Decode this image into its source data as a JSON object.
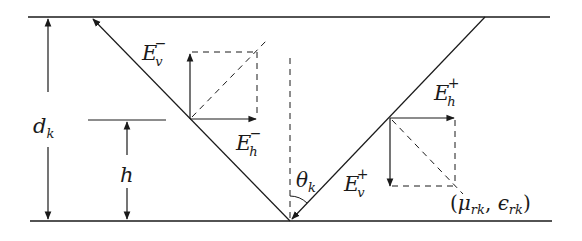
{
  "diagram": {
    "type": "layer-reflection-geometry",
    "colors": {
      "line": "#1a1a1a",
      "background": "#ffffff"
    },
    "boundaries": [
      {
        "name": "top-boundary",
        "y": 17
      },
      {
        "name": "bottom-boundary",
        "y": 221
      }
    ],
    "labels": {
      "thickness": {
        "base": "d",
        "sub": "k"
      },
      "height": {
        "base": "h"
      },
      "angle": {
        "base": "θ",
        "sub": "k"
      },
      "ev_minus": {
        "base": "E",
        "sub": "v",
        "sup": "−"
      },
      "eh_minus": {
        "base": "E",
        "sub": "h",
        "sup": "−"
      },
      "eh_plus": {
        "base": "E",
        "sub": "h",
        "sup": "+"
      },
      "ev_plus": {
        "base": "E",
        "sub": "v",
        "sup": "+"
      },
      "medium": {
        "open": "(",
        "mu": "μ",
        "mu_sub": "rk",
        "comma": ", ",
        "eps": "ϵ",
        "eps_sub": "rk",
        "close": ")"
      }
    }
  }
}
